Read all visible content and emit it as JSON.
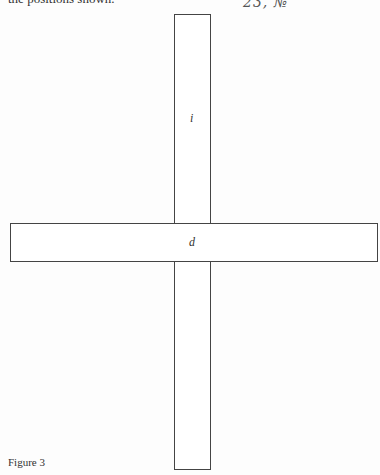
{
  "page": {
    "top_text_fragment": "the positions shown.",
    "handwritten_note": "23, №"
  },
  "figure": {
    "caption": "Figure 3",
    "shapes": [
      {
        "id": "vertical-bar",
        "label": "i",
        "orientation": "vertical"
      },
      {
        "id": "horizontal-bar",
        "label": "d",
        "orientation": "horizontal"
      }
    ]
  }
}
